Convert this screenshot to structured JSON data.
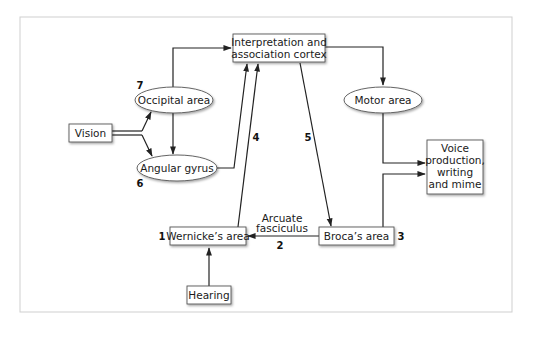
{
  "diagram": {
    "nodes": {
      "interpretation": {
        "lines": [
          "Interpretation and",
          "association cortex"
        ],
        "shape": "box"
      },
      "occipital": {
        "lines": [
          "Occipital area"
        ],
        "shape": "ellipse"
      },
      "angular": {
        "lines": [
          "Angular gyrus"
        ],
        "shape": "ellipse"
      },
      "vision": {
        "lines": [
          "Vision"
        ],
        "shape": "box"
      },
      "motor": {
        "lines": [
          "Motor area"
        ],
        "shape": "ellipse"
      },
      "voice": {
        "lines": [
          "Voice",
          "production,",
          "writing",
          "and mime"
        ],
        "shape": "box"
      },
      "wernicke": {
        "lines": [
          "Wernicke’s area"
        ],
        "shape": "box"
      },
      "broca": {
        "lines": [
          "Broca’s area"
        ],
        "shape": "box"
      },
      "hearing": {
        "lines": [
          "Hearing"
        ],
        "shape": "box"
      }
    },
    "step_numbers": {
      "wernicke": "1",
      "arcuate": "2",
      "broca": "3",
      "to_interpretation": "4",
      "from_interpretation": "5",
      "angular": "6",
      "occipital": "7"
    },
    "edge_labels": {
      "arcuate": [
        "Arcuate",
        "fasciculus"
      ]
    },
    "edges": [
      {
        "from": "vision",
        "to": "occipital"
      },
      {
        "from": "vision",
        "to": "angular"
      },
      {
        "from": "occipital",
        "to": "interpretation"
      },
      {
        "from": "occipital",
        "to": "angular"
      },
      {
        "from": "angular",
        "to": "interpretation"
      },
      {
        "from": "wernicke",
        "to": "interpretation"
      },
      {
        "from": "interpretation",
        "to": "motor"
      },
      {
        "from": "interpretation",
        "to": "broca"
      },
      {
        "from": "motor",
        "to": "voice"
      },
      {
        "from": "broca",
        "to": "voice"
      },
      {
        "from": "broca",
        "to": "wernicke"
      },
      {
        "from": "hearing",
        "to": "wernicke"
      }
    ],
    "colors": {
      "line": "#222222",
      "frame": "#cccccc",
      "node_border": "#555555"
    }
  }
}
